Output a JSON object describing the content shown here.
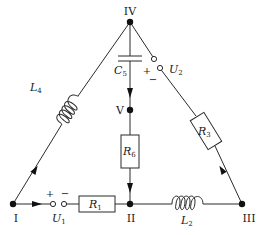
{
  "diagram": {
    "type": "electrical-circuit",
    "colors": {
      "line": "#2a2a2a",
      "node": "#111111",
      "background": "#ffffff"
    },
    "nodes": [
      {
        "id": "I",
        "label": "I",
        "x": 13,
        "y": 204
      },
      {
        "id": "II",
        "label": "II",
        "x": 130,
        "y": 204
      },
      {
        "id": "III",
        "label": "III",
        "x": 242,
        "y": 204
      },
      {
        "id": "IV",
        "label": "IV",
        "x": 130,
        "y": 22
      },
      {
        "id": "V",
        "label": "V",
        "x": 130,
        "y": 110
      }
    ],
    "components": {
      "R1": {
        "label": "R",
        "sub": "1",
        "kind": "resistor",
        "from": "I",
        "to": "II"
      },
      "U1": {
        "label": "U",
        "sub": "1",
        "kind": "voltage-source",
        "plus": "+",
        "minus": "−",
        "from": "I",
        "to": "II"
      },
      "L2": {
        "label": "L",
        "sub": "2",
        "kind": "inductor",
        "from": "II",
        "to": "III"
      },
      "R3": {
        "label": "R",
        "sub": "3",
        "kind": "resistor",
        "from": "III",
        "to": "IV"
      },
      "U2": {
        "label": "U",
        "sub": "2",
        "kind": "voltage-source",
        "plus": "+",
        "minus": "−",
        "from": "III",
        "to": "IV"
      },
      "L4": {
        "label": "L",
        "sub": "4",
        "kind": "inductor",
        "from": "I",
        "to": "IV"
      },
      "C5": {
        "label": "C",
        "sub": "5",
        "kind": "capacitor",
        "from": "IV",
        "to": "V"
      },
      "R6": {
        "label": "R",
        "sub": "6",
        "kind": "resistor",
        "from": "V",
        "to": "II"
      }
    },
    "current_arrows": [
      {
        "branch": "I-II",
        "direction": "I→II"
      },
      {
        "branch": "I-IV",
        "direction": "I→IV"
      },
      {
        "branch": "III-IV",
        "direction": "III→IV"
      },
      {
        "branch": "IV-V",
        "direction": "IV→V"
      },
      {
        "branch": "V-II",
        "direction": "V→II"
      }
    ]
  }
}
